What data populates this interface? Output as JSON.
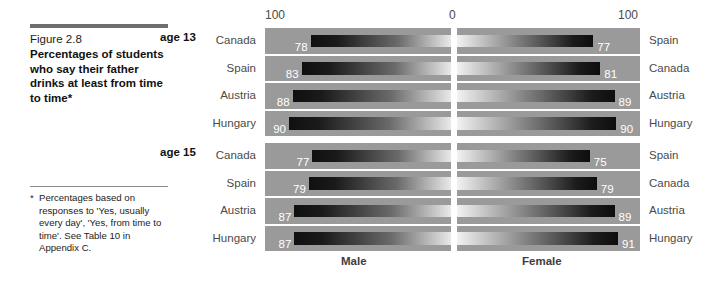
{
  "caption": {
    "figure_number": "Figure 2.8",
    "title": "Percentages of students who say their father drinks at least from time to time*"
  },
  "footnote": {
    "marker": "*",
    "text": "Percentages based on responses to 'Yes, usually every day', 'Yes, from time to time'. See Table 10 in Appendix C."
  },
  "axis": {
    "left_tick": "100",
    "center_tick": "0",
    "right_tick": "100"
  },
  "groups": [
    {
      "id": "age-13",
      "label": "age 13"
    },
    {
      "id": "age-15",
      "label": "age 15"
    }
  ],
  "sex_labels": {
    "male": "Male",
    "female": "Female"
  },
  "colors": {
    "panel_track": "#9a9a9a",
    "bar_dark": "#101010",
    "bar_light": "#f2f2f2",
    "value_text": "#ffffff",
    "country_text": "#4a4a4a",
    "caption_rule": "#6e6e6e"
  },
  "chart_data": {
    "type": "bar",
    "title": "Percentages of students who say their father drinks at least from time to time*",
    "subtitle": "Figure 2.8",
    "orientation": "horizontal-diverging",
    "xlabel": "",
    "ylabel": "",
    "xlim": [
      0,
      100
    ],
    "grid": false,
    "legend_position": "bottom",
    "axis_ticks": [
      "100",
      "0",
      "100"
    ],
    "series": [
      {
        "name": "Male",
        "side": "left"
      },
      {
        "name": "Female",
        "side": "right"
      }
    ],
    "groups": [
      {
        "name": "age 13",
        "rows": [
          {
            "left_country": "Canada",
            "left_value": 78,
            "right_country": "Spain",
            "right_value": 77
          },
          {
            "left_country": "Spain",
            "left_value": 83,
            "right_country": "Canada",
            "right_value": 81
          },
          {
            "left_country": "Austria",
            "left_value": 88,
            "right_country": "Austria",
            "right_value": 89
          },
          {
            "left_country": "Hungary",
            "left_value": 90,
            "right_country": "Hungary",
            "right_value": 90
          }
        ]
      },
      {
        "name": "age 15",
        "rows": [
          {
            "left_country": "Canada",
            "left_value": 77,
            "right_country": "Spain",
            "right_value": 75
          },
          {
            "left_country": "Spain",
            "left_value": 79,
            "right_country": "Canada",
            "right_value": 79
          },
          {
            "left_country": "Austria",
            "left_value": 87,
            "right_country": "Austria",
            "right_value": 89
          },
          {
            "left_country": "Hungary",
            "left_value": 87,
            "right_country": "Hungary",
            "right_value": 91
          }
        ]
      }
    ]
  }
}
